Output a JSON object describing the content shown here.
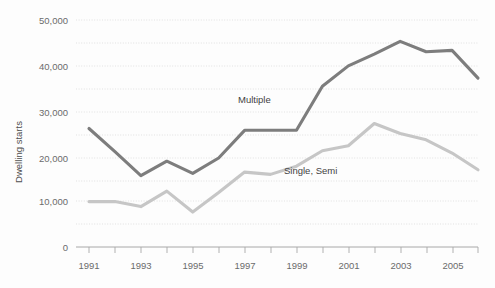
{
  "chart_data": {
    "type": "line",
    "title": "",
    "subtitle": "",
    "xlabel": "",
    "ylabel": "Dwelling starts",
    "x": [
      1991,
      1992,
      1993,
      1994,
      1995,
      1996,
      1997,
      1998,
      1999,
      2000,
      2001,
      2002,
      2003,
      2004,
      2005,
      2006
    ],
    "xtick_labels": [
      "1991",
      "",
      "1993",
      "",
      "1995",
      "",
      "1997",
      "",
      "1999",
      "",
      "2001",
      "",
      "2003",
      "",
      "2005",
      ""
    ],
    "xtick_labels_shown": [
      "1991",
      "1993",
      "1995",
      "1997",
      "1999",
      "2001",
      "2003",
      "2005"
    ],
    "ytick_labels": [
      "0",
      "10,000",
      "20,000",
      "30,000",
      "40,000",
      "50,000"
    ],
    "ytick_values": [
      0,
      10000,
      20000,
      30000,
      40000,
      50000
    ],
    "minor_gridline_values": [
      5000,
      15000,
      25000,
      35000,
      45000
    ],
    "xlim": [
      1991,
      2006
    ],
    "ylim": [
      0,
      50000
    ],
    "grid": true,
    "grid_style": "dotted horizontal",
    "legend_position": "inline labels on series",
    "series": [
      {
        "name": "Multiple",
        "color": "#7d7d7d",
        "label_x": 2000.0,
        "values": [
          26100,
          21000,
          15700,
          18900,
          16200,
          19600,
          25700,
          25700,
          25700,
          35400,
          39900,
          42500,
          45300,
          43000,
          43300,
          37200
        ]
      },
      {
        "name": "Single, Semi",
        "color": "#c6c6c6",
        "values": [
          10000,
          10000,
          8900,
          12300,
          7700,
          12000,
          16500,
          16000,
          17800,
          21200,
          22300,
          27200,
          25000,
          23600,
          20700,
          17000
        ]
      }
    ]
  },
  "series_labels": {
    "multiple": "Multiple",
    "single_semi": "Single, Semi"
  },
  "axis": {
    "y_title": "Dwelling starts"
  }
}
